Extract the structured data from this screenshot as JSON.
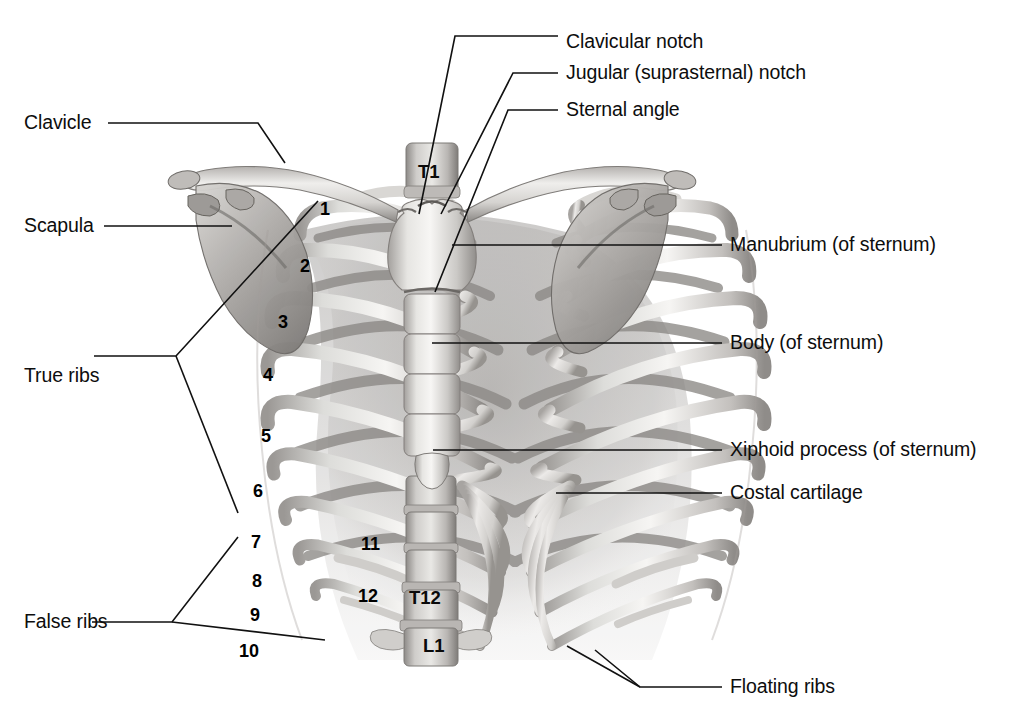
{
  "figure": {
    "background_color": "#ffffff",
    "line_color": "#111111",
    "text_color": "#0d0d0d",
    "bone_light": "#f2f1ef",
    "bone_mid": "#c9c7c4",
    "bone_dark": "#8e8b88",
    "shadow": "#6f6c69"
  },
  "labels_right": [
    {
      "id": "clavicular-notch",
      "text": "Clavicular notch",
      "x": 566,
      "y": 42
    },
    {
      "id": "jugular-notch",
      "text": "Jugular (suprasternal) notch",
      "x": 566,
      "y": 73
    },
    {
      "id": "sternal-angle",
      "text": "Sternal angle",
      "x": 566,
      "y": 110
    },
    {
      "id": "manubrium",
      "text": "Manubrium (of sternum)",
      "x": 730,
      "y": 245
    },
    {
      "id": "body-of-sternum",
      "text": "Body (of sternum)",
      "x": 730,
      "y": 343
    },
    {
      "id": "xiphoid-process",
      "text": "Xiphoid process (of sternum)",
      "x": 730,
      "y": 450
    },
    {
      "id": "costal-cartilage",
      "text": "Costal cartilage",
      "x": 730,
      "y": 493
    },
    {
      "id": "floating-ribs",
      "text": "Floating ribs",
      "x": 730,
      "y": 687
    }
  ],
  "labels_left": [
    {
      "id": "clavicle",
      "text": "Clavicle",
      "x": 24,
      "y": 123
    },
    {
      "id": "scapula",
      "text": "Scapula",
      "x": 24,
      "y": 226
    },
    {
      "id": "true-ribs",
      "text": "True ribs",
      "x": 24,
      "y": 376
    },
    {
      "id": "false-ribs",
      "text": "False ribs",
      "x": 24,
      "y": 622
    }
  ],
  "rib_numbers": [
    {
      "n": "1",
      "x": 320,
      "y": 200
    },
    {
      "n": "2",
      "x": 300,
      "y": 257
    },
    {
      "n": "3",
      "x": 278,
      "y": 313
    },
    {
      "n": "4",
      "x": 263,
      "y": 366
    },
    {
      "n": "5",
      "x": 261,
      "y": 427
    },
    {
      "n": "6",
      "x": 253,
      "y": 482
    },
    {
      "n": "7",
      "x": 251,
      "y": 533
    },
    {
      "n": "8",
      "x": 252,
      "y": 572
    },
    {
      "n": "9",
      "x": 250,
      "y": 606
    },
    {
      "n": "10",
      "x": 239,
      "y": 642
    },
    {
      "n": "11",
      "x": 361,
      "y": 535
    },
    {
      "n": "12",
      "x": 358,
      "y": 587
    }
  ],
  "vertebrae": [
    {
      "id": "t1",
      "text": "T1",
      "x": 418,
      "y": 163
    },
    {
      "id": "t12",
      "text": "T12",
      "x": 409,
      "y": 589
    },
    {
      "id": "l1",
      "text": "L1",
      "x": 423,
      "y": 637
    }
  ]
}
